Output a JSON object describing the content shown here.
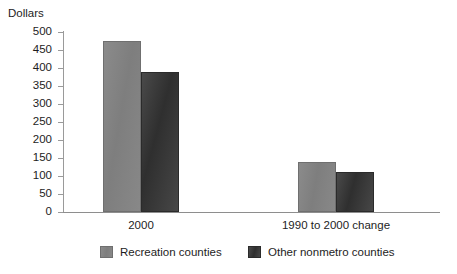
{
  "chart_data": {
    "type": "bar",
    "title": "",
    "xlabel": "",
    "ylabel": "Dollars",
    "ylim": [
      0,
      500
    ],
    "yticks": [
      0,
      50,
      100,
      150,
      200,
      250,
      300,
      350,
      400,
      450,
      500
    ],
    "ytick_labels": [
      "0",
      "50",
      "100",
      "150",
      "200",
      "250",
      "300",
      "350",
      "400",
      "450",
      "500"
    ],
    "grid": false,
    "legend_position": "bottom",
    "categories": [
      "2000",
      "1990 to 2000 change"
    ],
    "series": [
      {
        "name": "Recreation counties",
        "color": "#808080",
        "values": [
          475,
          140
        ]
      },
      {
        "name": "Other nonmetro counties",
        "color": "#3a3a3a",
        "values": [
          390,
          110
        ]
      }
    ]
  },
  "axes": {
    "y_title": "Dollars",
    "line_color": "#8e8e8e"
  }
}
